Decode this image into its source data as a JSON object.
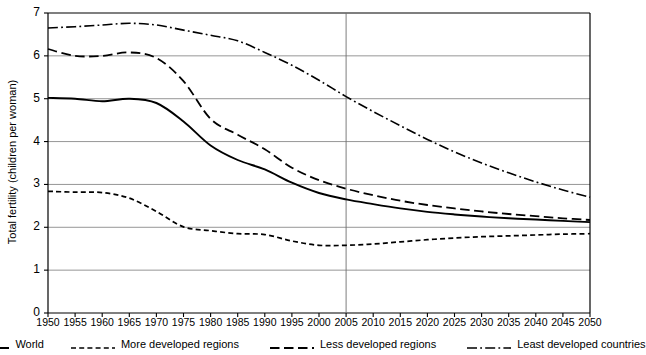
{
  "chart_data": {
    "type": "line",
    "title": "",
    "xlabel": "",
    "ylabel": "Total fertility (children per woman)",
    "xlim": [
      1950,
      2050
    ],
    "ylim": [
      0,
      7
    ],
    "ytick_step": 1,
    "xtick_step": 5,
    "grid": "horizontal",
    "legend_position": "bottom",
    "projection_divider_x": 2005,
    "xticks": [
      "1950",
      "1955",
      "1960",
      "1965",
      "1970",
      "1975",
      "1980",
      "1985",
      "1990",
      "1995",
      "2000",
      "2005",
      "2010",
      "2015",
      "2020",
      "2025",
      "2030",
      "2035",
      "2040",
      "2045",
      "2050"
    ],
    "yticks": [
      "0",
      "1",
      "2",
      "3",
      "4",
      "5",
      "6",
      "7"
    ],
    "x": [
      1950,
      1955,
      1960,
      1965,
      1970,
      1975,
      1980,
      1985,
      1990,
      1995,
      2000,
      2005,
      2010,
      2015,
      2020,
      2025,
      2030,
      2035,
      2040,
      2045,
      2050
    ],
    "series": [
      {
        "name": "World",
        "style": "solid",
        "color": "#000000",
        "values": [
          5.02,
          5.0,
          4.94,
          5.0,
          4.9,
          4.47,
          3.91,
          3.57,
          3.35,
          3.04,
          2.8,
          2.65,
          2.54,
          2.44,
          2.36,
          2.3,
          2.25,
          2.21,
          2.18,
          2.15,
          2.12
        ]
      },
      {
        "name": "More developed regions",
        "style": "dotted",
        "color": "#000000",
        "values": [
          2.84,
          2.82,
          2.81,
          2.68,
          2.37,
          2.01,
          1.92,
          1.85,
          1.83,
          1.68,
          1.58,
          1.58,
          1.61,
          1.66,
          1.71,
          1.75,
          1.78,
          1.8,
          1.82,
          1.84,
          1.85
        ]
      },
      {
        "name": "Less developed regions",
        "style": "dashed",
        "color": "#000000",
        "values": [
          6.16,
          6.0,
          6.0,
          6.08,
          5.95,
          5.41,
          4.53,
          4.16,
          3.82,
          3.39,
          3.1,
          2.9,
          2.75,
          2.62,
          2.52,
          2.44,
          2.37,
          2.31,
          2.26,
          2.21,
          2.17
        ]
      },
      {
        "name": "Least developed countries",
        "style": "dashdot",
        "color": "#000000",
        "values": [
          6.65,
          6.68,
          6.72,
          6.76,
          6.72,
          6.6,
          6.48,
          6.35,
          6.08,
          5.78,
          5.43,
          5.05,
          4.7,
          4.37,
          4.05,
          3.76,
          3.5,
          3.27,
          3.06,
          2.87,
          2.7
        ]
      }
    ]
  },
  "legend": {
    "items": [
      {
        "label": "World",
        "style": "solid"
      },
      {
        "label": "More developed regions",
        "style": "dotted"
      },
      {
        "label": "Less developed regions",
        "style": "dashed"
      },
      {
        "label": "Least developed countries",
        "style": "dashdot"
      }
    ]
  }
}
